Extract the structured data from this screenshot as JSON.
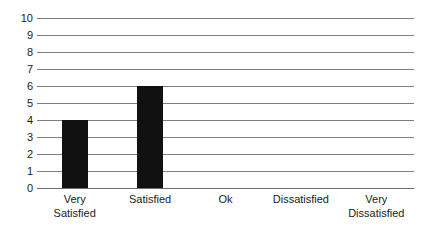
{
  "chart_data": {
    "type": "bar",
    "title": "",
    "subtitle": "",
    "xlabel": "",
    "ylabel": "",
    "categories": [
      "Very Satisfied",
      "Satisfied",
      "Ok",
      "Dissatisfied",
      "Very Dissatisfied"
    ],
    "category_lines": [
      [
        "Very",
        "Satisfied"
      ],
      [
        "Satisfied"
      ],
      [
        "Ok"
      ],
      [
        "Dissatisfied"
      ],
      [
        "Very",
        "Dissatisfied"
      ]
    ],
    "values": [
      4,
      6,
      0,
      0,
      0
    ],
    "ylim": [
      0,
      10
    ],
    "ytick_labels": [
      "10",
      "9",
      "8",
      "7",
      "6",
      "5",
      "4",
      "3",
      "2",
      "1",
      "0"
    ],
    "ytick_values": [
      10,
      9,
      8,
      7,
      6,
      5,
      4,
      3,
      2,
      1,
      0
    ],
    "grid": true,
    "grid_axis": "y",
    "legend": false,
    "legend_position": "none",
    "colors": {
      "bar": "#111111",
      "gridline": "#7f7f7f",
      "baseline": "#6e6e6e",
      "text": "#1b1b1b",
      "background": "#ffffff"
    }
  }
}
